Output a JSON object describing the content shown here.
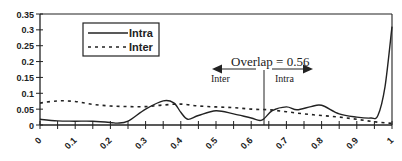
{
  "chart_data": {
    "type": "line",
    "title": "",
    "xlabel": "",
    "ylabel": "",
    "xlim": [
      0,
      1
    ],
    "ylim": [
      0,
      0.35
    ],
    "grid": false,
    "legend_position": "upper-left (inside)",
    "x_ticks": [
      "0",
      "0.1",
      "0.2",
      "0.3",
      "0.4",
      "0.5",
      "0.6",
      "0.7",
      "0.8",
      "0.9",
      "1"
    ],
    "y_ticks": [
      "0",
      "0.05",
      "0.1",
      "0.15",
      "0.2",
      "0.25",
      "0.3",
      "0.35"
    ],
    "series": [
      {
        "name": "Intra",
        "style": "solid",
        "color": "#222222",
        "x": [
          0,
          0.05,
          0.1,
          0.15,
          0.2,
          0.22,
          0.25,
          0.3,
          0.35,
          0.38,
          0.4,
          0.42,
          0.45,
          0.5,
          0.55,
          0.6,
          0.63,
          0.66,
          0.7,
          0.73,
          0.77,
          0.8,
          0.85,
          0.9,
          0.94,
          0.96,
          0.98,
          1.0
        ],
        "values": [
          0.018,
          0.013,
          0.012,
          0.012,
          0.008,
          0.006,
          0.012,
          0.05,
          0.076,
          0.07,
          0.04,
          0.018,
          0.03,
          0.045,
          0.035,
          0.022,
          0.015,
          0.045,
          0.057,
          0.048,
          0.058,
          0.062,
          0.035,
          0.025,
          0.022,
          0.03,
          0.12,
          0.31
        ]
      },
      {
        "name": "Inter",
        "style": "dashed",
        "color": "#222222",
        "x": [
          0,
          0.05,
          0.1,
          0.15,
          0.2,
          0.25,
          0.3,
          0.35,
          0.4,
          0.45,
          0.5,
          0.55,
          0.6,
          0.65,
          0.7,
          0.75,
          0.8,
          0.85,
          0.9,
          0.95,
          1.0
        ],
        "values": [
          0.069,
          0.076,
          0.074,
          0.065,
          0.06,
          0.058,
          0.058,
          0.063,
          0.066,
          0.06,
          0.057,
          0.055,
          0.05,
          0.048,
          0.042,
          0.035,
          0.03,
          0.025,
          0.018,
          0.01,
          0.005
        ]
      }
    ],
    "annotations": [
      {
        "text": "Overlap = 0.56",
        "x": 0.64
      },
      {
        "text": "Inter",
        "arrow": "left"
      },
      {
        "text": "Intra",
        "arrow": "right"
      }
    ],
    "overlap_line_x": 0.64
  },
  "legend": {
    "intra_label": "Intra",
    "inter_label": "Inter"
  },
  "annotation": {
    "overlap_text": "Overlap = 0.56",
    "left_label": "Inter",
    "right_label": "Intra"
  }
}
